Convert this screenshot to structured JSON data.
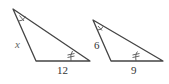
{
  "diagram": {
    "type": "similar-triangles",
    "triangles": [
      {
        "id": "left",
        "vertices": {
          "apex": [
            13,
            9
          ],
          "bottom_left": [
            36,
            61
          ],
          "bottom_right": [
            90,
            61
          ]
        },
        "labels": {
          "left_side": "x",
          "bottom_side": "12"
        },
        "markings": {
          "apex_angle": "single-arc-tick",
          "bottom_right_angle": "double-arc-tick"
        }
      },
      {
        "id": "right",
        "vertices": {
          "apex": [
            93,
            20
          ],
          "bottom_left": [
            111,
            61
          ],
          "bottom_right": [
            163,
            61
          ]
        },
        "labels": {
          "left_side": "6",
          "bottom_side": "9"
        },
        "markings": {
          "apex_angle": "single-arc-tick",
          "bottom_right_angle": "double-arc-tick"
        }
      }
    ],
    "colors": {
      "stroke": "#444444",
      "label": "#333333",
      "variable_label": "#666666"
    }
  }
}
